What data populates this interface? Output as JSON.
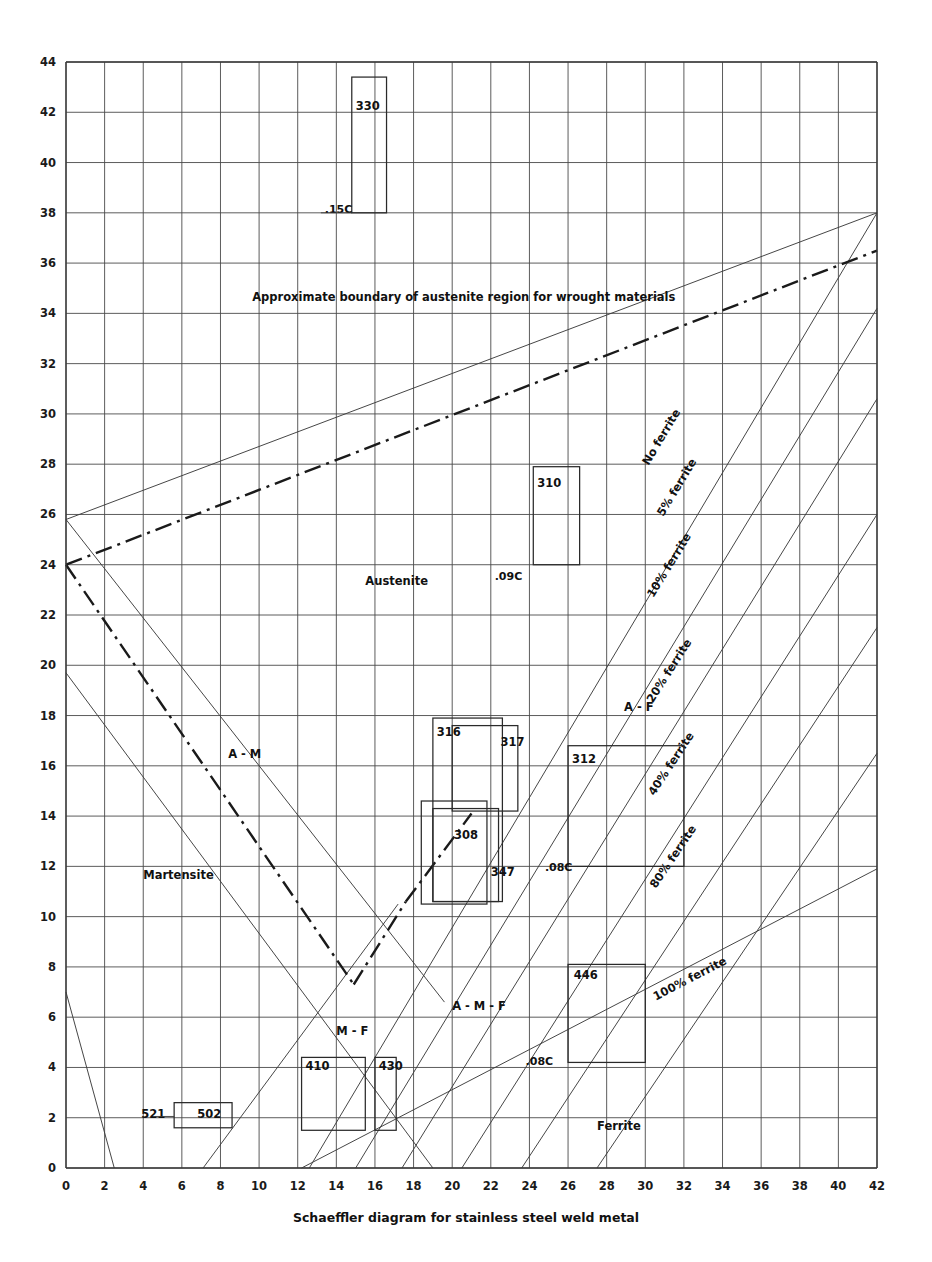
{
  "chart_data": {
    "type": "line",
    "title": "Schaeffler diagram for stainless steel weld metal",
    "caption": "Schaeffler diagram for stainless steel weld metal",
    "xlabel": "",
    "ylabel": "",
    "xlim": [
      0,
      42
    ],
    "ylim": [
      0,
      44
    ],
    "x_ticks": [
      0,
      2,
      4,
      6,
      8,
      10,
      12,
      14,
      16,
      18,
      20,
      22,
      24,
      26,
      28,
      30,
      32,
      34,
      36,
      38,
      40,
      42
    ],
    "y_ticks": [
      0,
      2,
      4,
      6,
      8,
      10,
      12,
      14,
      16,
      18,
      20,
      22,
      24,
      26,
      28,
      30,
      32,
      34,
      36,
      38,
      40,
      42,
      44
    ],
    "grid": true,
    "legend_position": "none",
    "annotation_note": "Approximate boundary of austenite region for wrought materials",
    "region_labels": [
      {
        "text": "Austenite",
        "x": 15.5,
        "y": 23.2
      },
      {
        "text": "Martensite",
        "x": 4.0,
        "y": 11.5
      },
      {
        "text": "Ferrite",
        "x": 27.5,
        "y": 1.5
      },
      {
        "text": "A - M",
        "x": 8.4,
        "y": 16.3
      },
      {
        "text": "A - F",
        "x": 28.9,
        "y": 18.2
      },
      {
        "text": "A - M - F",
        "x": 20.0,
        "y": 6.3
      },
      {
        "text": "M - F",
        "x": 14.0,
        "y": 5.3
      }
    ],
    "ferrite_lines": [
      {
        "label": "No ferrite",
        "label_x": 31.0,
        "label_y": 29.0,
        "x0": 12.6,
        "y0": 0.0,
        "x1": 42.0,
        "y1": 38.0
      },
      {
        "label": "5% ferrite",
        "label_x": 31.8,
        "label_y": 27.0,
        "x0": 15.0,
        "y0": 0.0,
        "x1": 42.0,
        "y1": 34.2
      },
      {
        "label": "10% ferrite",
        "label_x": 31.4,
        "label_y": 23.9,
        "x0": 17.4,
        "y0": 0.0,
        "x1": 42.0,
        "y1": 30.6
      },
      {
        "label": "20% ferrite",
        "label_x": 31.4,
        "label_y": 19.7,
        "x0": 20.5,
        "y0": 0.0,
        "x1": 42.0,
        "y1": 26.0
      },
      {
        "label": "40% ferrite",
        "label_x": 31.5,
        "label_y": 16.0,
        "x0": 23.6,
        "y0": 0.0,
        "x1": 42.0,
        "y1": 21.5
      },
      {
        "label": "80% ferrite",
        "label_x": 31.6,
        "label_y": 12.3,
        "x0": 27.5,
        "y0": 0.0,
        "x1": 42.0,
        "y1": 16.5
      },
      {
        "label": "100% ferrite",
        "label_x": 32.4,
        "label_y": 7.4,
        "x0": 12.2,
        "y0": 0.0,
        "x1": 42.0,
        "y1": 11.9
      }
    ],
    "carbon_labels": [
      {
        "text": ".15C",
        "x": 13.4,
        "y": 38.0
      },
      {
        "text": ".09C",
        "x": 22.2,
        "y": 23.4
      },
      {
        "text": ".08C",
        "x": 24.8,
        "y": 11.8
      },
      {
        "text": ".08C",
        "x": 23.8,
        "y": 4.1
      }
    ],
    "grade_boxes": [
      {
        "label": "330",
        "x0": 14.8,
        "x1": 16.6,
        "y0": 38.0,
        "y1": 43.4,
        "label_x": 15.0,
        "label_y": 42.1
      },
      {
        "label": "310",
        "x0": 24.2,
        "x1": 26.6,
        "y0": 24.0,
        "y1": 27.9,
        "label_x": 24.4,
        "label_y": 27.1
      },
      {
        "label": "316",
        "x0": 19.0,
        "x1": 22.6,
        "y0": 10.6,
        "y1": 17.9,
        "label_x": 19.2,
        "label_y": 17.2
      },
      {
        "label": "317",
        "x0": 20.0,
        "x1": 23.4,
        "y0": 14.2,
        "y1": 17.6,
        "label_x": 22.5,
        "label_y": 16.8
      },
      {
        "label": "312",
        "x0": 26.0,
        "x1": 32.0,
        "y0": 12.0,
        "y1": 16.8,
        "label_x": 26.2,
        "label_y": 16.1
      },
      {
        "label": "308",
        "x0": 18.4,
        "x1": 21.8,
        "y0": 10.5,
        "y1": 14.6,
        "label_x": 20.1,
        "label_y": 13.1
      },
      {
        "label": "347",
        "x0": 19.0,
        "x1": 22.4,
        "y0": 10.6,
        "y1": 14.3,
        "label_x": 22.0,
        "label_y": 11.6
      },
      {
        "label": "446",
        "x0": 26.0,
        "x1": 30.0,
        "y0": 4.2,
        "y1": 8.1,
        "label_x": 26.3,
        "label_y": 7.5
      },
      {
        "label": "410",
        "x0": 12.2,
        "x1": 15.5,
        "y0": 1.5,
        "y1": 4.4,
        "label_x": 12.4,
        "label_y": 3.9
      },
      {
        "label": "430",
        "x0": 16.0,
        "x1": 17.1,
        "y0": 1.5,
        "y1": 4.4,
        "label_x": 16.2,
        "label_y": 3.9
      },
      {
        "label": "502",
        "x0": 5.6,
        "x1": 8.6,
        "y0": 1.6,
        "y1": 2.6,
        "label_x": 6.8,
        "label_y": 2.0
      },
      {
        "label": "521",
        "x0": null,
        "x1": null,
        "y0": null,
        "y1": null,
        "label_x": 3.9,
        "label_y": 2.0
      }
    ],
    "boundary_line": {
      "name": "austenite-boundary-dashdot",
      "x0": 0.0,
      "y0": 24.0,
      "x1": 42.0,
      "y1": 36.5
    },
    "wrought_boundary_line": {
      "name": "austenite-boundary-thin",
      "x0": 0.0,
      "y0": 25.8,
      "x1": 42.0,
      "y1": 38.0
    },
    "phase_lines": [
      {
        "name": "a-m-upper",
        "x0": 0.0,
        "y0": 19.7,
        "x1": 19.0,
        "y1": 0.0
      },
      {
        "name": "m-f-left",
        "x0": 0.0,
        "y0": 7.0,
        "x1": 2.5,
        "y1": 0.0
      },
      {
        "name": "m-f-diagonal",
        "x0": 7.1,
        "y0": 0.0,
        "x1": 17.2,
        "y1": 10.5
      }
    ]
  },
  "figure": {
    "caption": "Schaeffler diagram for stainless steel weld metal",
    "note": "Approximate boundary of austenite region for wrought materials"
  }
}
